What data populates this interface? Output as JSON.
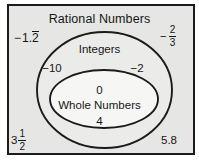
{
  "diagram": {
    "type": "nested-venn-euler",
    "title": "Rational Numbers",
    "frame": {
      "background_color": "#e6e6e4",
      "border_color": "#1b1b1b"
    },
    "sets": [
      {
        "name": "Rational Numbers",
        "label": "Rational Numbers",
        "level": 0,
        "members_shown": [
          "-1.2 repeating",
          "-2/3",
          "3 1/2",
          "5.8"
        ]
      },
      {
        "name": "Integers",
        "label": "Integers",
        "level": 1,
        "members_shown": [
          "-10",
          "-2"
        ]
      },
      {
        "name": "Whole Numbers",
        "label": "Whole Numbers",
        "level": 2,
        "members_shown": [
          "0",
          "4"
        ]
      }
    ],
    "labels": {
      "rational_numbers": "Rational Numbers",
      "integers": "Integers",
      "whole_numbers": "Whole Numbers"
    },
    "values": {
      "neg_ten": "−10",
      "neg_two": "−2",
      "zero": "0",
      "four": "4",
      "five_point_eight": "5.8",
      "neg_one_point_two_repeating": {
        "sign": "−",
        "integer_part": "1.",
        "repeating_digit": "2",
        "plain": "−1.2̅"
      },
      "neg_two_thirds": {
        "sign": "−",
        "numerator": "2",
        "denominator": "3",
        "plain": "−2/3"
      },
      "three_and_one_half": {
        "whole": "3",
        "numerator": "1",
        "denominator": "2",
        "plain": "3 1/2"
      }
    },
    "colors": {
      "ink": "#161616",
      "outline": "#1b1b1b",
      "fill": "#e6e6e4",
      "inner_fill": "#f2f2f0",
      "page": "#ffffff"
    }
  }
}
